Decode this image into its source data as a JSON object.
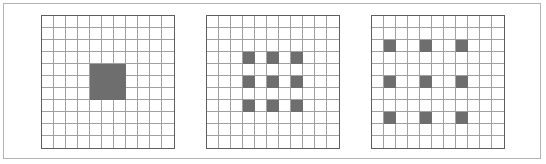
{
  "figure": {
    "background_color": "#ffffff",
    "frame_color": "#b4b4b4",
    "grid_line_color": "#a0a0a0",
    "grid_border_color": "#5e5e5e",
    "fill_color": "#6e6e6e",
    "panel_count": 3
  },
  "chart_data": {
    "type": "heatmap",
    "xlabel": "",
    "ylabel": "",
    "grid": true,
    "legend_position": "none",
    "cell_size_px": 12,
    "panels": [
      {
        "name": "panel-dilation-1",
        "label": "",
        "rows": 11,
        "cols": 11,
        "dilation": 1,
        "kernel_size": 3,
        "receptive_field": 3,
        "filled_rows": [
          4,
          5,
          6
        ],
        "filled_cols": [
          4,
          5,
          6
        ],
        "filled_cells": [
          [
            4,
            4
          ],
          [
            4,
            5
          ],
          [
            4,
            6
          ],
          [
            5,
            4
          ],
          [
            5,
            5
          ],
          [
            5,
            6
          ],
          [
            6,
            4
          ],
          [
            6,
            5
          ],
          [
            6,
            6
          ]
        ],
        "filled_count": 9
      },
      {
        "name": "panel-dilation-2",
        "label": "",
        "rows": 11,
        "cols": 11,
        "dilation": 2,
        "kernel_size": 3,
        "receptive_field": 5,
        "filled_rows": [
          3,
          5,
          7
        ],
        "filled_cols": [
          3,
          5,
          7
        ],
        "filled_cells": [
          [
            3,
            3
          ],
          [
            3,
            5
          ],
          [
            3,
            7
          ],
          [
            5,
            3
          ],
          [
            5,
            5
          ],
          [
            5,
            7
          ],
          [
            7,
            3
          ],
          [
            7,
            5
          ],
          [
            7,
            7
          ]
        ],
        "filled_count": 9
      },
      {
        "name": "panel-dilation-3",
        "label": "",
        "rows": 11,
        "cols": 11,
        "dilation": 3,
        "kernel_size": 3,
        "receptive_field": 7,
        "filled_rows": [
          2,
          5,
          8
        ],
        "filled_cols": [
          1,
          4,
          7
        ],
        "filled_cells": [
          [
            2,
            1
          ],
          [
            2,
            4
          ],
          [
            2,
            7
          ],
          [
            5,
            1
          ],
          [
            5,
            4
          ],
          [
            5,
            7
          ],
          [
            8,
            1
          ],
          [
            8,
            4
          ],
          [
            8,
            7
          ]
        ],
        "filled_count": 9
      }
    ]
  }
}
